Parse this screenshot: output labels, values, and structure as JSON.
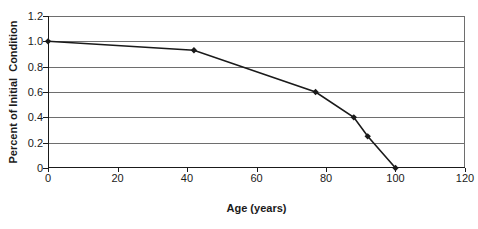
{
  "figure": {
    "background": "#ffffff"
  },
  "chart_data": {
    "type": "line",
    "title": "",
    "xlabel": "Age (years)",
    "ylabel": "Percent of Initial  Condition",
    "xlim": [
      0,
      120
    ],
    "ylim": [
      0,
      1.2
    ],
    "grid": "horizontal",
    "legend": "none",
    "xticks": [
      "0",
      "20",
      "40",
      "60",
      "80",
      "100",
      "120"
    ],
    "yticks": [
      "1.2",
      "1.0",
      "0.8",
      "0.6",
      "0.4",
      "0.2",
      "0"
    ],
    "series": [
      {
        "name": "percent-of-initial-condition",
        "marker": "diamond",
        "x": [
          0,
          42,
          77,
          88,
          92,
          100
        ],
        "y": [
          1.0,
          0.93,
          0.6,
          0.4,
          0.25,
          0.0
        ]
      }
    ],
    "colors": {
      "line": "#1a1a1a",
      "grid": "#6e6e6e",
      "axis": "#1a1a1a",
      "text": "#1a1a1a"
    }
  }
}
